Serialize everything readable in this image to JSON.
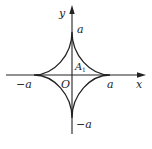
{
  "diagram": {
    "type": "astroid",
    "axes": {
      "x_label": "x",
      "y_label": "y",
      "origin_label": "O"
    },
    "labels": {
      "top": "a",
      "bottom": "−a",
      "left": "−a",
      "right": "a",
      "region_main": "A",
      "region_sub": "1"
    },
    "colors": {
      "stroke": "#222222",
      "background": "#ffffff"
    }
  }
}
